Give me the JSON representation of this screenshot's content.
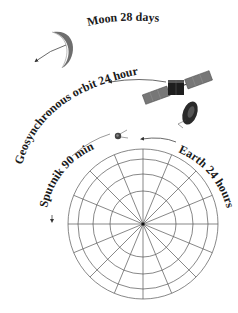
{
  "diagram": {
    "labels": {
      "moon": "Moon 28 days",
      "geo": "Geosynchronous orbit 24 hours",
      "sputnik": "Sputnik 90 min",
      "earth": "Earth 24 hours"
    },
    "icons": {
      "moon": "crescent-moon",
      "satellite": "geosynchronous-satellite",
      "sputnik": "sputnik-satellite",
      "earth": "earth-polar-grid"
    },
    "earth_grid": {
      "rings": 4,
      "spokes": 16
    },
    "colors": {
      "line": "#555555",
      "text": "#1a1a1a",
      "moon": "#6e6e6e",
      "panel": "#777777",
      "body": "#1e1e1e"
    }
  }
}
